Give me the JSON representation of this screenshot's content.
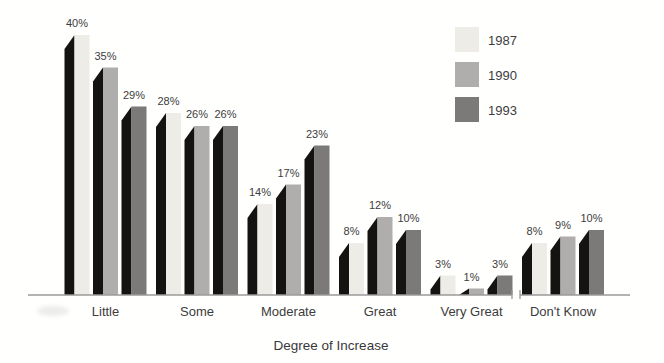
{
  "chart_data": {
    "type": "bar",
    "title": "",
    "xlabel": "Degree of Increase",
    "ylabel": "",
    "value_suffix": "%",
    "ylim": [
      0,
      42
    ],
    "grid": false,
    "legend_position": "top-right",
    "axis_break_after_category": "Very Great",
    "categories": [
      "Little",
      "Some",
      "Moderate",
      "Great",
      "Very Great",
      "Don't Know"
    ],
    "series": [
      {
        "name": "1987",
        "color": "#edece7",
        "values": [
          40,
          28,
          14,
          8,
          3,
          8
        ]
      },
      {
        "name": "1990",
        "color": "#afaeac",
        "values": [
          35,
          26,
          17,
          12,
          1,
          9
        ]
      },
      {
        "name": "1993",
        "color": "#7b7a78",
        "values": [
          29,
          26,
          23,
          10,
          3,
          10
        ]
      }
    ],
    "shadow_color": "#151311",
    "axis_color": "#9a9a98",
    "label_color": "#3c3c3c"
  }
}
